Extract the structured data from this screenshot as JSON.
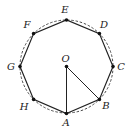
{
  "diagram": {
    "type": "regular-octagon-inscribed-in-circle",
    "center": {
      "label": "O",
      "x": 66.5,
      "y": 66.5
    },
    "circle": {
      "radius": 46.5,
      "style": "dashed"
    },
    "vertices": [
      {
        "label": "A",
        "x": 66.5,
        "y": 113.5,
        "lx": 66,
        "ly": 126
      },
      {
        "label": "B",
        "x": 99.4,
        "y": 99.4,
        "lx": 106,
        "ly": 109
      },
      {
        "label": "C",
        "x": 113.0,
        "y": 66.5,
        "lx": 121,
        "ly": 70
      },
      {
        "label": "D",
        "x": 99.4,
        "y": 33.6,
        "lx": 104,
        "ly": 28
      },
      {
        "label": "E",
        "x": 66.5,
        "y": 20.0,
        "lx": 65,
        "ly": 13
      },
      {
        "label": "F",
        "x": 33.6,
        "y": 33.6,
        "lx": 27,
        "ly": 28
      },
      {
        "label": "G",
        "x": 20.0,
        "y": 66.5,
        "lx": 11,
        "ly": 70
      },
      {
        "label": "H",
        "x": 33.6,
        "y": 99.4,
        "lx": 24,
        "ly": 110
      }
    ],
    "segments": [
      {
        "from": "O",
        "to": "A"
      },
      {
        "from": "O",
        "to": "B"
      }
    ],
    "colors": {
      "stroke": "#222222",
      "dash": "#333333"
    }
  }
}
